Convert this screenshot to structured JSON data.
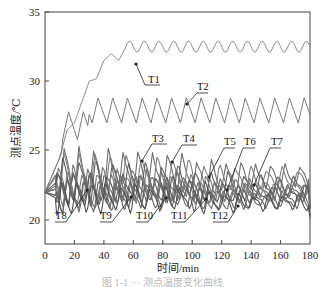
{
  "chart_data": {
    "type": "line",
    "title": "",
    "xlabel": "时间/min",
    "ylabel": "测点温度/℃",
    "xlim": [
      0,
      180
    ],
    "ylim": [
      17,
      35
    ],
    "xticks": [
      0,
      20,
      40,
      60,
      80,
      100,
      120,
      140,
      160,
      180
    ],
    "yticks": [
      20,
      25,
      30,
      35
    ],
    "grid": false,
    "legend": "none (inline callout labels)",
    "annotations": [
      "T1",
      "T2",
      "T3",
      "T4",
      "T5",
      "T6",
      "T7",
      "T8",
      "T9",
      "T10",
      "T11",
      "T12"
    ],
    "series": [
      {
        "name": "T1",
        "x": [
          0,
          10,
          15,
          20,
          25,
          30,
          35,
          40,
          45,
          50,
          55,
          60,
          70,
          80,
          90,
          100,
          110,
          120,
          130,
          140,
          150,
          160,
          170,
          180
        ],
        "values": [
          22.0,
          24.5,
          26.5,
          27.0,
          28.5,
          30.0,
          30.2,
          31.5,
          32.0,
          31.5,
          32.5,
          32.8,
          32.5,
          32.9,
          32.5,
          32.9,
          32.6,
          32.9,
          32.6,
          32.9,
          32.6,
          32.8,
          32.5,
          32.9
        ]
      },
      {
        "name": "T2",
        "x": [
          0,
          10,
          15,
          20,
          25,
          30,
          35,
          40,
          45,
          50,
          55,
          60,
          70,
          80,
          90,
          100,
          110,
          120,
          130,
          140,
          150,
          160,
          170,
          180
        ],
        "values": [
          22.0,
          23.5,
          25.5,
          26.5,
          28.0,
          26.5,
          28.5,
          27.0,
          28.7,
          27.0,
          28.7,
          27.0,
          28.8,
          27.1,
          28.8,
          27.1,
          28.8,
          27.1,
          28.8,
          27.1,
          28.8,
          27.1,
          28.7,
          28.5
        ]
      },
      {
        "name": "T3",
        "values_range": [
          21.5,
          25.3
        ],
        "description": "sawtooth oscillation ~22-25, decaying amplitude"
      },
      {
        "name": "T4",
        "values_range": [
          21.5,
          25.0
        ],
        "description": "sawtooth oscillation ~22-25"
      },
      {
        "name": "T5",
        "values_range": [
          21.0,
          24.5
        ],
        "description": "sawtooth oscillation"
      },
      {
        "name": "T6",
        "values_range": [
          21.0,
          24.0
        ],
        "description": "sawtooth oscillation"
      },
      {
        "name": "T7",
        "values_range": [
          21.0,
          23.5
        ],
        "description": "sawtooth oscillation"
      },
      {
        "name": "T8",
        "values_range": [
          21.0,
          23.5
        ],
        "description": "sawtooth oscillation"
      },
      {
        "name": "T9",
        "values_range": [
          21.0,
          23.5
        ],
        "description": "sawtooth oscillation"
      },
      {
        "name": "T10",
        "values_range": [
          20.5,
          23.0
        ],
        "description": "sawtooth oscillation"
      },
      {
        "name": "T11",
        "values_range": [
          20.5,
          23.0
        ],
        "description": "sawtooth oscillation"
      },
      {
        "name": "T12",
        "values_range": [
          20.3,
          22.8
        ],
        "description": "sawtooth oscillation"
      }
    ]
  },
  "axes": {
    "x_title": "时间/min",
    "y_title": "测点温度/℃",
    "x_ticks": [
      "0",
      "20",
      "40",
      "60",
      "80",
      "100",
      "120",
      "140",
      "160",
      "180"
    ],
    "y_ticks": [
      "20",
      "25",
      "30",
      "35"
    ]
  },
  "labels": {
    "T1": "T1",
    "T2": "T2",
    "T3": "T3",
    "T4": "T4",
    "T5": "T5",
    "T6": "T6",
    "T7": "T7",
    "T8": "T8",
    "T9": "T9",
    "T10": "T10",
    "T11": "T11",
    "T12": "T12"
  },
  "caption": "图 1-1  ···  测点温度变化曲线"
}
